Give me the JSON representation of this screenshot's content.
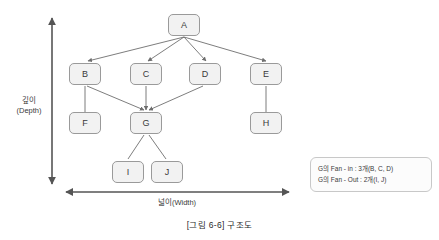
{
  "figure": {
    "caption": "[그림 6-6] 구조도"
  },
  "axes": {
    "vertical": {
      "label_line1": "깊이",
      "label_line2": "(Depth)"
    },
    "horizontal": {
      "label": "넓이(Width)"
    }
  },
  "nodes": [
    {
      "id": "A",
      "label": "A",
      "x": 168,
      "y": 14
    },
    {
      "id": "B",
      "label": "B",
      "x": 69,
      "y": 63
    },
    {
      "id": "C",
      "label": "C",
      "x": 130,
      "y": 63
    },
    {
      "id": "D",
      "label": "D",
      "x": 189,
      "y": 63
    },
    {
      "id": "E",
      "label": "E",
      "x": 250,
      "y": 63
    },
    {
      "id": "F",
      "label": "F",
      "x": 69,
      "y": 112
    },
    {
      "id": "G",
      "label": "G",
      "x": 130,
      "y": 112
    },
    {
      "id": "H",
      "label": "H",
      "x": 250,
      "y": 112
    },
    {
      "id": "I",
      "label": "I",
      "x": 112,
      "y": 161
    },
    {
      "id": "J",
      "label": "J",
      "x": 151,
      "y": 161
    }
  ],
  "edges": [
    {
      "from": "A",
      "to": "B"
    },
    {
      "from": "A",
      "to": "C"
    },
    {
      "from": "A",
      "to": "D"
    },
    {
      "from": "A",
      "to": "E"
    },
    {
      "from": "B",
      "to": "F"
    },
    {
      "from": "B",
      "to": "G"
    },
    {
      "from": "C",
      "to": "G"
    },
    {
      "from": "D",
      "to": "G"
    },
    {
      "from": "E",
      "to": "H"
    },
    {
      "from": "G",
      "to": "I"
    },
    {
      "from": "G",
      "to": "J"
    }
  ],
  "legend": {
    "line1": "G의 Fan - in : 3개(B, C, D)",
    "line2": "G의 Fan - Out : 2개(I, J)"
  },
  "colors": {
    "node_fill": "#f2f2f2",
    "node_border": "#9a9a9a",
    "edge": "#6e6e6e",
    "axis": "#555555",
    "legend_border": "#c8c8c8",
    "text": "#3a3a3a"
  }
}
